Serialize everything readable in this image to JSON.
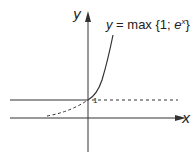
{
  "figure": {
    "axes": {
      "x_label": "x",
      "y_label": "y"
    },
    "formula": {
      "lhs": "y",
      "eq": " = max {1; ",
      "base": "e",
      "exp": "x",
      "close": "}"
    },
    "tick_one": "1",
    "colors": {
      "line": "#333333",
      "background": "#ffffff"
    },
    "curves": [
      {
        "name": "y = 1 for x < 0",
        "style": "solid"
      },
      {
        "name": "e^x for x > 0",
        "style": "solid"
      },
      {
        "name": "e^x for x < 0",
        "style": "dashed"
      },
      {
        "name": "y = 1 for x > 0",
        "style": "dashed"
      }
    ]
  }
}
